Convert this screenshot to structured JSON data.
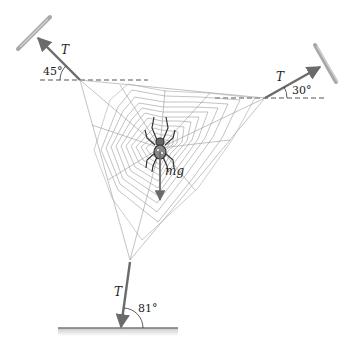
{
  "diagram": {
    "labels": {
      "tension_top_left": "T",
      "angle_top_left": "45°",
      "tension_top_right": "T",
      "angle_top_right": "30°",
      "tension_bottom": "T",
      "angle_bottom": "81°",
      "weight": "mg"
    },
    "forces": [
      {
        "name": "tension-top-left",
        "label": "T",
        "angle_deg": 45,
        "reference": "horizontal",
        "direction": "up-left"
      },
      {
        "name": "tension-top-right",
        "label": "T",
        "angle_deg": 30,
        "reference": "horizontal",
        "direction": "up-right"
      },
      {
        "name": "tension-bottom",
        "label": "T",
        "angle_deg": 81,
        "reference": "ground",
        "direction": "down"
      },
      {
        "name": "weight",
        "label": "mg",
        "direction": "down"
      }
    ],
    "colors": {
      "arrow": "#6b6b6b",
      "web": "#9a9a9a",
      "dashed": "#555555",
      "mount": "#a8a8a8",
      "text": "#222222"
    }
  }
}
